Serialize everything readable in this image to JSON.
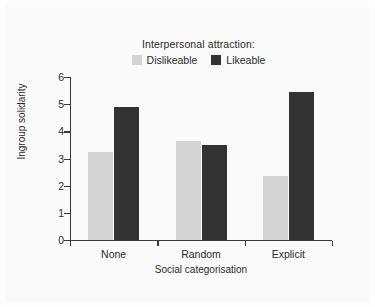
{
  "chart_data": {
    "type": "bar",
    "title": "",
    "subtitle": "",
    "legend_title": "Interpersonal attraction:",
    "legend_position": "top-center",
    "categories": [
      "None",
      "Random",
      "Explicit"
    ],
    "series": [
      {
        "name": "Dislikeable",
        "color": "#d4d4d4",
        "values": [
          3.25,
          3.65,
          2.35
        ]
      },
      {
        "name": "Likeable",
        "color": "#333333",
        "values": [
          4.9,
          3.5,
          5.45
        ]
      }
    ],
    "xlabel": "Social categorisation",
    "ylabel": "Ingroup solidarity",
    "ylim": [
      0,
      6
    ],
    "yticks": [
      0,
      1,
      2,
      3,
      4,
      5,
      6
    ],
    "ytick_labels": [
      "0",
      "1",
      "2",
      "3",
      "4",
      "5",
      "6"
    ],
    "grid": false
  },
  "figure": {
    "background_color": "#fafafa",
    "axis_color": "#3a3a3a",
    "text_color": "#2b2b2b"
  }
}
